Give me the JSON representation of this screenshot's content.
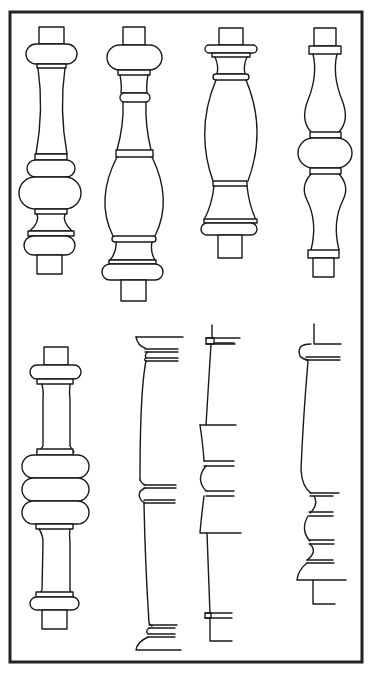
{
  "figure": {
    "colors": {
      "ink": "#1a1a1a",
      "frame": "#222222",
      "background": "#ffffff"
    },
    "frame": {
      "x": 10,
      "y": 12,
      "width": 352,
      "height": 650
    },
    "top_row": [
      {
        "id": "baluster-1",
        "label": "Baluster with bulbous lower body and slender tapered neck",
        "cx": 51
      },
      {
        "id": "baluster-2",
        "label": "Baluster with vase-shaped lower body and ringed neck",
        "cx": 133
      },
      {
        "id": "baluster-3",
        "label": "Baluster with tall barrel body",
        "cx": 231
      },
      {
        "id": "baluster-4",
        "label": "Double-vase baluster with central ball",
        "cx": 322
      }
    ],
    "bottom_row": [
      {
        "id": "baluster-5",
        "label": "Baluster with triple ring centre",
        "cx": 55
      },
      {
        "id": "profile-1",
        "label": "Half profile of tapered column with capital, astragal and base"
      },
      {
        "id": "profile-2",
        "label": "Half profile of stepped column with central collar"
      },
      {
        "id": "profile-3",
        "label": "Half profile of column with moulded lower section"
      }
    ]
  }
}
